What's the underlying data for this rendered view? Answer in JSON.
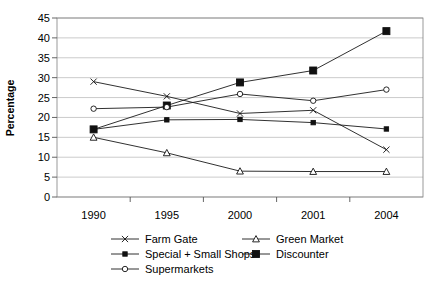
{
  "chart_data": {
    "type": "line",
    "title": "",
    "xlabel": "",
    "ylabel": "Percentage",
    "categories": [
      "1990",
      "1995",
      "2000",
      "2001",
      "2004"
    ],
    "ylim": [
      0,
      45
    ],
    "yticks": [
      0,
      5,
      10,
      15,
      20,
      25,
      30,
      35,
      40,
      45
    ],
    "grid": true,
    "legend_position": "bottom",
    "series": [
      {
        "name": "Farm Gate",
        "marker": "cross",
        "values": [
          29.0,
          25.3,
          21.0,
          21.8,
          11.9
        ]
      },
      {
        "name": "Green Market",
        "marker": "open-triangle",
        "values": [
          15.0,
          11.1,
          6.5,
          6.4,
          6.4
        ]
      },
      {
        "name": "Special + Small Shops",
        "marker": "small-filled-square",
        "values": [
          17.0,
          19.4,
          19.5,
          18.7,
          17.1
        ]
      },
      {
        "name": "Discounter",
        "marker": "large-filled-square",
        "values": [
          17.0,
          23.0,
          28.8,
          31.8,
          41.7
        ]
      },
      {
        "name": "Supermarkets",
        "marker": "open-circle",
        "values": [
          22.2,
          22.6,
          25.9,
          24.2,
          27.0
        ]
      }
    ]
  },
  "legend": {
    "entries": [
      {
        "label": "Farm Gate"
      },
      {
        "label": "Green Market"
      },
      {
        "label": "Special + Small Shops"
      },
      {
        "label": "Discounter"
      },
      {
        "label": "Supermarkets"
      }
    ]
  },
  "axis": {
    "y_title": "Percentage",
    "y_tick_labels": [
      "45",
      "40",
      "35",
      "30",
      "25",
      "20",
      "15",
      "10",
      "5",
      "0"
    ],
    "x_tick_labels": [
      "1990",
      "1995",
      "2000",
      "2001",
      "2004"
    ]
  },
  "colors": {
    "line": "#1a1a1a",
    "grid": "#b5b5b5",
    "frame": "#808080",
    "background": "#ffffff"
  }
}
